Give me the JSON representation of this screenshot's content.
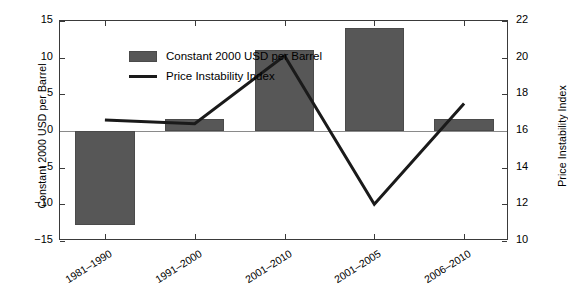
{
  "chart_data": {
    "type": "bar",
    "title": "",
    "xlabel": "",
    "ylabel": "Constant 2000 USD per Barrel",
    "ylabel_right": "Price Instability Index",
    "categories": [
      "1981–1990",
      "1991–2000",
      "2001–2010",
      "2001–2005",
      "2006–2010"
    ],
    "grid": false,
    "legend_position": "top-left",
    "ylim": [
      -15,
      15
    ],
    "ylim_right": [
      10,
      22
    ],
    "yticks": [
      "15",
      "10",
      "5",
      "0",
      "−5",
      "−10",
      "−15"
    ],
    "ytick_values": [
      15,
      10,
      5,
      0,
      -5,
      -10,
      -15
    ],
    "yticks_right": [
      "22",
      "20",
      "18",
      "16",
      "14",
      "12",
      "10"
    ],
    "ytick_values_right": [
      22,
      20,
      18,
      16,
      14,
      12,
      10
    ],
    "series": [
      {
        "name": "Constant 2000 USD per Barrel",
        "type": "bar",
        "axis": "left",
        "color": "#575757",
        "values": [
          -12.8,
          1.7,
          11.1,
          14.1,
          1.6
        ]
      },
      {
        "name": "Price Instability Index",
        "type": "line",
        "axis": "right",
        "color": "#1a1a1a",
        "values": [
          16.6,
          16.4,
          20.1,
          12.0,
          17.5
        ]
      }
    ]
  },
  "legend": {
    "items": [
      {
        "label": "Constant 2000 USD per Barrel",
        "marker": "bar-swatch"
      },
      {
        "label": "Price Instability Index",
        "marker": "line-swatch"
      }
    ]
  },
  "axes": {
    "left_title": "Constant 2000 USD per Barrel",
    "right_title": "Price Instability Index"
  }
}
